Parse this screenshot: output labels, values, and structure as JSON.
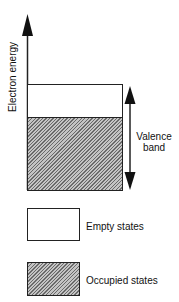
{
  "diagram": {
    "axis": {
      "label": "Electron energy",
      "direction": "up"
    },
    "band": {
      "label_line1": "Valence",
      "label_line2": "band",
      "regions": [
        {
          "name": "empty",
          "fill": "#ffffff"
        },
        {
          "name": "occupied",
          "fill": "hatched-gray"
        }
      ]
    },
    "legend": [
      {
        "label": "Empty states",
        "fill": "#ffffff"
      },
      {
        "label": "Occupied states",
        "fill": "hatched-gray"
      }
    ],
    "colors": {
      "line": "#222222",
      "hatch_dark": "#6a6a6a",
      "hatch_light": "#c4c4c4"
    }
  }
}
